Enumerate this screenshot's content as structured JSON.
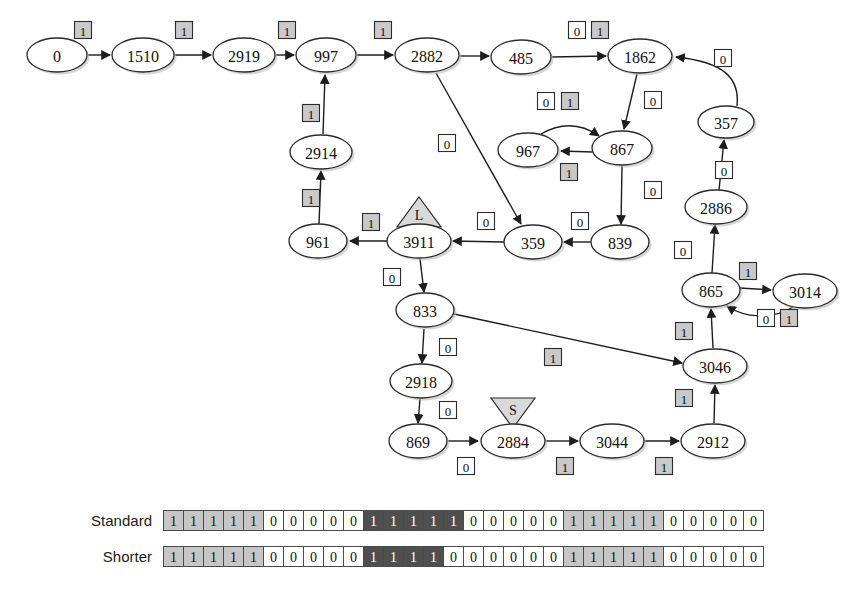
{
  "figure": {
    "type": "state-transition-diagram",
    "nodes": [
      {
        "id": "n0",
        "label": "0",
        "x": 57,
        "y": 55,
        "rx": 30,
        "ry": 17
      },
      {
        "id": "n1510",
        "label": "1510",
        "x": 143,
        "y": 55,
        "rx": 31,
        "ry": 17
      },
      {
        "id": "n2919",
        "label": "2919",
        "x": 244,
        "y": 55,
        "rx": 31,
        "ry": 17
      },
      {
        "id": "n997",
        "label": "997",
        "x": 326,
        "y": 55,
        "rx": 30,
        "ry": 17
      },
      {
        "id": "n2882",
        "label": "2882",
        "x": 427,
        "y": 55,
        "rx": 32,
        "ry": 17
      },
      {
        "id": "n485",
        "label": "485",
        "x": 521,
        "y": 57,
        "rx": 30,
        "ry": 17
      },
      {
        "id": "n1862",
        "label": "1862",
        "x": 640,
        "y": 56,
        "rx": 32,
        "ry": 17
      },
      {
        "id": "n357",
        "label": "357",
        "x": 726,
        "y": 122,
        "rx": 28,
        "ry": 16
      },
      {
        "id": "n967",
        "label": "967",
        "x": 528,
        "y": 150,
        "rx": 30,
        "ry": 17
      },
      {
        "id": "n867",
        "label": "867",
        "x": 622,
        "y": 148,
        "rx": 30,
        "ry": 17
      },
      {
        "id": "n2914",
        "label": "2914",
        "x": 321,
        "y": 152,
        "rx": 31,
        "ry": 17
      },
      {
        "id": "n2886",
        "label": "2886",
        "x": 716,
        "y": 207,
        "rx": 31,
        "ry": 17
      },
      {
        "id": "n961",
        "label": "961",
        "x": 318,
        "y": 241,
        "rx": 29,
        "ry": 17
      },
      {
        "id": "n3911",
        "label": "3911",
        "x": 419,
        "y": 241,
        "rx": 32,
        "ry": 17
      },
      {
        "id": "n359",
        "label": "359",
        "x": 533,
        "y": 242,
        "rx": 29,
        "ry": 17
      },
      {
        "id": "n839",
        "label": "839",
        "x": 620,
        "y": 242,
        "rx": 29,
        "ry": 17
      },
      {
        "id": "n865",
        "label": "865",
        "x": 711,
        "y": 290,
        "rx": 29,
        "ry": 17
      },
      {
        "id": "n3014",
        "label": "3014",
        "x": 805,
        "y": 291,
        "rx": 32,
        "ry": 17
      },
      {
        "id": "n833",
        "label": "833",
        "x": 425,
        "y": 310,
        "rx": 29,
        "ry": 17
      },
      {
        "id": "n3046",
        "label": "3046",
        "x": 715,
        "y": 366,
        "rx": 32,
        "ry": 17
      },
      {
        "id": "n2918",
        "label": "2918",
        "x": 421,
        "y": 381,
        "rx": 31,
        "ry": 17
      },
      {
        "id": "n869",
        "label": "869",
        "x": 418,
        "y": 441,
        "rx": 29,
        "ry": 17
      },
      {
        "id": "n2884",
        "label": "2884",
        "x": 513,
        "y": 441,
        "rx": 32,
        "ry": 17
      },
      {
        "id": "n3044",
        "label": "3044",
        "x": 612,
        "y": 441,
        "rx": 32,
        "ry": 17
      },
      {
        "id": "n2912",
        "label": "2912",
        "x": 713,
        "y": 441,
        "rx": 32,
        "ry": 17
      }
    ],
    "markers": [
      {
        "id": "marker-L",
        "label": "L",
        "x": 419,
        "y": 212,
        "target": "n3911"
      },
      {
        "id": "marker-S",
        "label": "S",
        "x": 513,
        "y": 413,
        "target": "n2884"
      }
    ],
    "edge_labels": [
      {
        "bit": "1",
        "x": 83,
        "y": 30
      },
      {
        "bit": "1",
        "x": 184,
        "y": 30
      },
      {
        "bit": "1",
        "x": 287,
        "y": 30
      },
      {
        "bit": "1",
        "x": 383,
        "y": 30
      },
      {
        "bit": "0",
        "x": 577,
        "y": 30
      },
      {
        "bit": "1",
        "x": 600,
        "y": 30
      },
      {
        "bit": "0",
        "x": 723,
        "y": 58
      },
      {
        "bit": "0",
        "x": 546,
        "y": 101
      },
      {
        "bit": "1",
        "x": 570,
        "y": 101
      },
      {
        "bit": "0",
        "x": 653,
        "y": 100
      },
      {
        "bit": "1",
        "x": 311,
        "y": 113
      },
      {
        "bit": "0",
        "x": 447,
        "y": 143
      },
      {
        "bit": "1",
        "x": 569,
        "y": 172
      },
      {
        "bit": "0",
        "x": 724,
        "y": 170
      },
      {
        "bit": "0",
        "x": 653,
        "y": 190
      },
      {
        "bit": "1",
        "x": 311,
        "y": 198
      },
      {
        "bit": "1",
        "x": 371,
        "y": 222
      },
      {
        "bit": "0",
        "x": 486,
        "y": 221
      },
      {
        "bit": "0",
        "x": 580,
        "y": 221
      },
      {
        "bit": "0",
        "x": 683,
        "y": 250
      },
      {
        "bit": "1",
        "x": 748,
        "y": 271
      },
      {
        "bit": "0",
        "x": 392,
        "y": 277
      },
      {
        "bit": "0",
        "x": 766,
        "y": 318
      },
      {
        "bit": "1",
        "x": 789,
        "y": 318
      },
      {
        "bit": "1",
        "x": 684,
        "y": 331
      },
      {
        "bit": "1",
        "x": 553,
        "y": 357
      },
      {
        "bit": "0",
        "x": 448,
        "y": 347
      },
      {
        "bit": "1",
        "x": 684,
        "y": 398
      },
      {
        "bit": "0",
        "x": 448,
        "y": 410
      },
      {
        "bit": "0",
        "x": 466,
        "y": 466
      },
      {
        "bit": "1",
        "x": 565,
        "y": 466
      },
      {
        "bit": "1",
        "x": 664,
        "y": 466
      }
    ]
  },
  "strips": {
    "rows": [
      {
        "label": "Standard",
        "bits": [
          "1",
          "1",
          "1",
          "1",
          "1",
          "0",
          "0",
          "0",
          "0",
          "0",
          "1",
          "1",
          "1",
          "1",
          "1",
          "0",
          "0",
          "0",
          "0",
          "0",
          "1",
          "1",
          "1",
          "1",
          "1",
          "0",
          "0",
          "0",
          "0",
          "0"
        ],
        "shades": [
          "light",
          "light",
          "light",
          "light",
          "light",
          "white",
          "white",
          "white",
          "white",
          "white",
          "dark",
          "dark",
          "dark",
          "dark",
          "dark",
          "white",
          "white",
          "white",
          "white",
          "white",
          "light",
          "light",
          "light",
          "light",
          "light",
          "white",
          "white",
          "white",
          "white",
          "white"
        ]
      },
      {
        "label": "Shorter",
        "bits": [
          "1",
          "1",
          "1",
          "1",
          "1",
          "0",
          "0",
          "0",
          "0",
          "0",
          "1",
          "1",
          "1",
          "1",
          "0",
          "0",
          "0",
          "0",
          "0",
          "0",
          "1",
          "1",
          "1",
          "1",
          "1",
          "0",
          "0",
          "0",
          "0",
          "0"
        ],
        "shades": [
          "light",
          "light",
          "light",
          "light",
          "light",
          "white",
          "white",
          "white",
          "white",
          "white",
          "dark",
          "dark",
          "dark",
          "dark",
          "white",
          "white",
          "white",
          "white",
          "white",
          "white",
          "light",
          "light",
          "light",
          "light",
          "light",
          "white",
          "white",
          "white",
          "white",
          "white"
        ]
      }
    ]
  },
  "colors": {
    "shade_light": "#c6c6c6",
    "shade_dark": "#4f4f4f",
    "shade_white": "#ffffff",
    "stroke": "#2b2b2b"
  }
}
